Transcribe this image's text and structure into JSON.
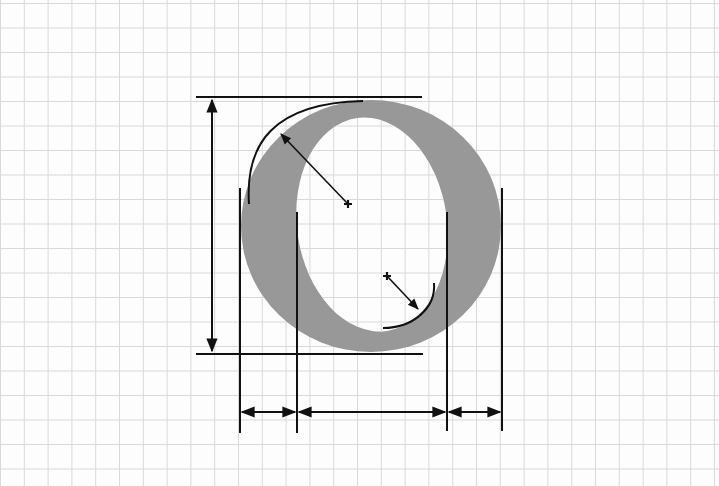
{
  "diagram": {
    "subject": "Construction of letter O with measurement guides",
    "canvas": {
      "width": 719,
      "height": 486,
      "background": "#fdfdfd"
    },
    "grid": {
      "spacing_x": 23.8,
      "spacing_y": 24.5,
      "offset_x": 0.5,
      "offset_y": 3.5,
      "color": "#d9d9d9"
    },
    "colors": {
      "glyph_fill": "#989898",
      "line": "#111111",
      "counter_fill": "#fdfdfd"
    },
    "glyph": {
      "letter": "O",
      "outer": {
        "cx": 371,
        "cy": 226,
        "rx": 130,
        "ry": 126,
        "top": 100,
        "bottom": 352,
        "left": 241,
        "right": 501
      },
      "counter": {
        "top": 117,
        "bottom": 332,
        "left": 297,
        "right": 447
      }
    },
    "guides": {
      "cap_line": {
        "x1": 196,
        "x2": 422,
        "y": 97
      },
      "base_line": {
        "x1": 196,
        "x2": 423,
        "y": 354
      },
      "height_arrow": {
        "x": 212,
        "y1": 98,
        "y2": 353
      },
      "vertical_lines": [
        {
          "x": 240,
          "y1": 188,
          "y2": 433
        },
        {
          "x": 297,
          "y1": 212,
          "y2": 433
        },
        {
          "x": 447,
          "y1": 212,
          "y2": 431
        },
        {
          "x": 502,
          "y1": 188,
          "y2": 431
        }
      ],
      "width_arrows_y": 412,
      "outer_arc": {
        "from": [
          249,
          204
        ],
        "to": [
          363,
          101
        ]
      },
      "inner_arc": {
        "from": [
          383,
          328
        ],
        "to": [
          434,
          283
        ]
      },
      "radius_arrows": [
        {
          "center": [
            348,
            204
          ],
          "tip": [
            281,
            134
          ]
        },
        {
          "center": [
            387,
            276
          ],
          "tip": [
            418,
            309
          ]
        }
      ]
    },
    "labels": []
  }
}
